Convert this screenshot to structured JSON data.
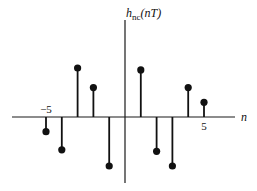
{
  "chart_data": {
    "type": "stem",
    "title": "",
    "ylabel": "h_nc(nT)",
    "ylabel_main": "h",
    "ylabel_sub": "nc",
    "ylabel_arg": "(nT)",
    "xlabel": "n",
    "x_tick_labels": [
      {
        "n": -5,
        "label": "−5"
      },
      {
        "n": 5,
        "label": "5"
      }
    ],
    "x": [
      -5,
      -4,
      -3,
      -2,
      -1,
      0,
      1,
      2,
      3,
      4,
      5
    ],
    "values": [
      -0.3,
      -0.67,
      1.0,
      0.6,
      -1.0,
      0,
      0.96,
      -0.7,
      -1.0,
      0.6,
      0.3
    ],
    "grid": false,
    "legend": null
  }
}
